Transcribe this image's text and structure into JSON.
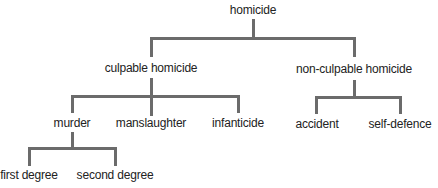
{
  "diagram": {
    "type": "tree",
    "colors": {
      "line": "#6b6b6b",
      "text": "#222222",
      "background": "#ffffff"
    },
    "root": {
      "label": "homicide",
      "children": [
        {
          "label": "culpable homicide",
          "children": [
            {
              "label": "murder",
              "children": [
                {
                  "label": "first degree"
                },
                {
                  "label": "second degree"
                }
              ]
            },
            {
              "label": "manslaughter"
            },
            {
              "label": "infanticide"
            }
          ]
        },
        {
          "label": "non-culpable homicide",
          "children": [
            {
              "label": "accident"
            },
            {
              "label": "self-defence"
            }
          ]
        }
      ]
    }
  }
}
